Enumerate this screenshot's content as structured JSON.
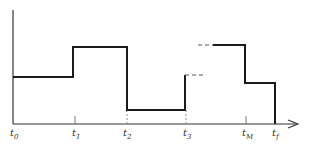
{
  "diagram": {
    "type": "step-function",
    "colors": {
      "line": "#1a1a1a",
      "axis": "#333333",
      "dashed": "#555555"
    },
    "x_labels": [
      {
        "id": "t0",
        "base": "t",
        "sub": "0"
      },
      {
        "id": "t1",
        "base": "t",
        "sub": "1"
      },
      {
        "id": "t2",
        "base": "t",
        "sub": "2"
      },
      {
        "id": "t3",
        "base": "t",
        "sub": "3"
      },
      {
        "id": "tM",
        "base": "t",
        "sub": "M"
      },
      {
        "id": "tf",
        "base": "t",
        "sub": "f"
      }
    ],
    "segments": [
      {
        "from": "t0",
        "to": "t1",
        "level": 0.45
      },
      {
        "from": "t1",
        "to": "t2",
        "level": 0.73
      },
      {
        "from": "t2",
        "to": "t3",
        "level": 0.13
      },
      {
        "from": "t3",
        "to": "tM",
        "level": 0.46,
        "note": "continues as dashed after t3"
      },
      {
        "from": "tM",
        "to": "tf",
        "level": 0.38
      }
    ]
  }
}
